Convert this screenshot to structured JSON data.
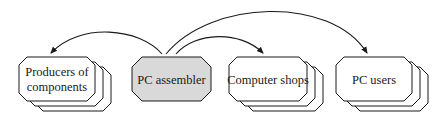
{
  "diagram": {
    "type": "flow",
    "center_node": {
      "id": "pc-assembler",
      "label": "PC assembler",
      "fill": "#d9d9d9"
    },
    "nodes": [
      {
        "id": "producers",
        "label_lines": [
          "Producers of",
          "components"
        ],
        "stacked": true
      },
      {
        "id": "pc-assembler",
        "label_lines": [
          "PC assembler"
        ],
        "stacked": false
      },
      {
        "id": "computer-shops",
        "label_lines": [
          "Computer shops"
        ],
        "stacked": true
      },
      {
        "id": "pc-users",
        "label_lines": [
          "PC users"
        ],
        "stacked": true
      }
    ],
    "edges": [
      {
        "from": "pc-assembler",
        "to": "producers"
      },
      {
        "from": "pc-assembler",
        "to": "computer-shops"
      },
      {
        "from": "pc-assembler",
        "to": "pc-users"
      }
    ],
    "colors": {
      "stroke": "#1a1a1a",
      "node_fill": "#ffffff",
      "center_fill": "#d9d9d9"
    }
  }
}
